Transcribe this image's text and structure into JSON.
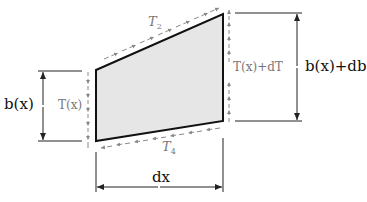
{
  "diagram": {
    "colors": {
      "fill": "#e6e6e6",
      "outline": "#111111",
      "traction": "#8a8a8a",
      "dimension": "#222222",
      "label_dark": "#111111",
      "label_gray": "#777777"
    },
    "labels": {
      "T2": {
        "base": "T",
        "sub": "2"
      },
      "T4": {
        "base": "T",
        "sub": "4"
      },
      "Tx": {
        "text": "T(x)"
      },
      "TxdT": {
        "text": "T(x)+dT"
      },
      "bx": {
        "text": "b(x)"
      },
      "bxdb": {
        "text": "b(x)+db"
      },
      "dx": {
        "text": "dx"
      }
    }
  }
}
